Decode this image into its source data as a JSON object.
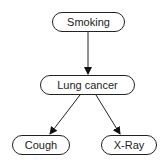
{
  "diagram": {
    "type": "bayesian-network",
    "nodes": [
      {
        "id": "smoking",
        "label": "Smoking"
      },
      {
        "id": "lung_cancer",
        "label": "Lung cancer"
      },
      {
        "id": "cough",
        "label": "Cough"
      },
      {
        "id": "xray",
        "label": "X-Ray"
      }
    ],
    "edges": [
      {
        "from": "smoking",
        "to": "lung_cancer"
      },
      {
        "from": "lung_cancer",
        "to": "cough"
      },
      {
        "from": "lung_cancer",
        "to": "xray"
      }
    ]
  }
}
